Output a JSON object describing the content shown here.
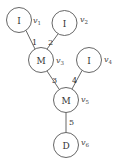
{
  "diagram": {
    "nodes": [
      {
        "id": "v1",
        "symbol": "I",
        "label": "v",
        "sub": "1",
        "cx": 19,
        "cy": 20,
        "r": 12.5
      },
      {
        "id": "v2",
        "symbol": "I",
        "label": "v",
        "sub": "2",
        "cx": 64.5,
        "cy": 23,
        "r": 12.5
      },
      {
        "id": "v3",
        "symbol": "M",
        "label": "v",
        "sub": "3",
        "cx": 41,
        "cy": 60,
        "r": 12.5
      },
      {
        "id": "v4",
        "symbol": "I",
        "label": "v",
        "sub": "4",
        "cx": 89,
        "cy": 60,
        "r": 12.5
      },
      {
        "id": "v5",
        "symbol": "M",
        "label": "v",
        "sub": "5",
        "cx": 66,
        "cy": 100,
        "r": 12.5
      },
      {
        "id": "v6",
        "symbol": "D",
        "label": "v",
        "sub": "6",
        "cx": 66,
        "cy": 145,
        "r": 12.5
      }
    ],
    "edges": [
      {
        "from": "v1",
        "to": "v3",
        "label": "1"
      },
      {
        "from": "v2",
        "to": "v3",
        "label": "2"
      },
      {
        "from": "v3",
        "to": "v5",
        "label": "3"
      },
      {
        "from": "v4",
        "to": "v5",
        "label": "4"
      },
      {
        "from": "v5",
        "to": "v6",
        "label": "5"
      }
    ]
  }
}
